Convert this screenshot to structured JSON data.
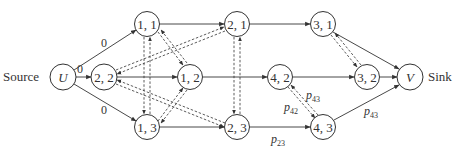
{
  "diagram": {
    "source_label": "Source",
    "sink_label": "Sink",
    "nodes": {
      "U": {
        "label": "U",
        "italic": true
      },
      "n22": {
        "label": "2, 2"
      },
      "n11": {
        "label": "1, 1"
      },
      "n13": {
        "label": "1, 3"
      },
      "n12": {
        "label": "1, 2"
      },
      "n21": {
        "label": "2, 1"
      },
      "n23": {
        "label": "2, 3"
      },
      "n42": {
        "label": "4, 2"
      },
      "n31": {
        "label": "3, 1"
      },
      "n32": {
        "label": "3, 2"
      },
      "n43": {
        "label": "4, 3"
      },
      "V": {
        "label": "V",
        "italic": true
      }
    },
    "edge_labels": {
      "u_11": "0",
      "u_22": "0",
      "u_13": "0",
      "p42": "p",
      "p42_sub": "42",
      "p43a": "p",
      "p43a_sub": "43",
      "p43b": "p",
      "p43b_sub": "43",
      "p23": "p",
      "p23_sub": "23"
    },
    "colors": {
      "stroke": "#333333",
      "background": "#ffffff"
    }
  }
}
